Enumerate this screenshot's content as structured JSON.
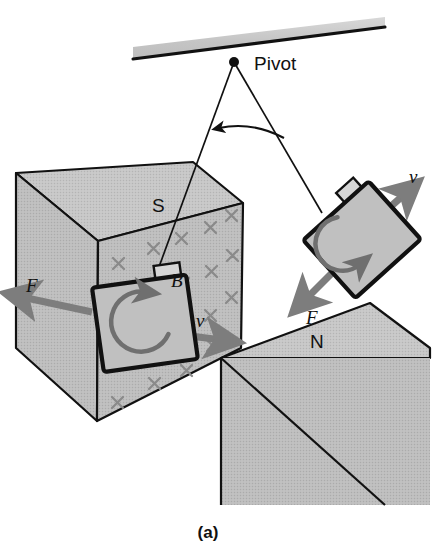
{
  "figure": {
    "caption": "(a)",
    "title_labels": {
      "pivot": "Pivot",
      "south_pole": "S",
      "north_pole": "N",
      "field": "B",
      "force_left": "F",
      "force_right": "F",
      "velocity_left": "v",
      "velocity_right": "v"
    }
  },
  "colors": {
    "magnet_fill": "#b9b9b9",
    "magnet_fill_top": "#c2c2c2",
    "coil_fill": "#c0c0c0",
    "outline": "#111111",
    "arrow_gray": "#7d7d7d",
    "field_mark": "#8a8a8a",
    "ceiling_fill": "#c8c8c8",
    "background": "#ffffff",
    "text": "#111111"
  },
  "ceiling": {
    "name": "support-bar",
    "description": "tilted horizontal support bar at top"
  },
  "pivot": {
    "label": "Pivot",
    "x": 234,
    "y": 62
  },
  "pendulums": [
    {
      "name": "pendulum-left",
      "position": "left",
      "string_from": "pivot",
      "bob_label_rotation": "counterclockwise",
      "velocity_label": "v",
      "force_label": "F",
      "field_label": "B"
    },
    {
      "name": "pendulum-right",
      "position": "right",
      "string_from": "pivot",
      "bob_label_rotation": "clockwise",
      "velocity_label": "v",
      "force_label": "F"
    }
  ],
  "magnets": [
    {
      "name": "magnet-south",
      "pole_label": "S",
      "field_marks": "x",
      "field_label": "B",
      "field_direction": "into page"
    },
    {
      "name": "magnet-north",
      "pole_label": "N",
      "field_marks": "none"
    }
  ],
  "angle_arc": {
    "name": "swing-angle-arc",
    "has_arrowhead": true,
    "direction": "left"
  }
}
